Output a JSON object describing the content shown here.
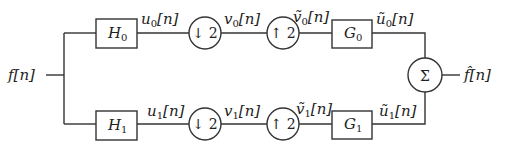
{
  "diagram": {
    "type": "two-channel filter bank",
    "input": {
      "label": "f[n]"
    },
    "output": {
      "label": "f̂[n]"
    },
    "sum_node": {
      "symbol": "Σ"
    },
    "branches": [
      {
        "analysis_filter": {
          "name": "H",
          "sub": "0"
        },
        "u_label": {
          "base": "u",
          "sub": "0",
          "tail": "[n]"
        },
        "downsample": {
          "symbol": "↓ 2"
        },
        "v_label": {
          "base": "v",
          "sub": "0",
          "tail": "[n]"
        },
        "upsample": {
          "symbol": "↑ 2"
        },
        "vt_label": {
          "base": "ṽ",
          "sub": "0",
          "tail": "[n]"
        },
        "synthesis_filter": {
          "name": "G",
          "sub": "0"
        },
        "ut_label": {
          "base": "ũ",
          "sub": "0",
          "tail": "[n]"
        }
      },
      {
        "analysis_filter": {
          "name": "H",
          "sub": "1"
        },
        "u_label": {
          "base": "u",
          "sub": "1",
          "tail": "[n]"
        },
        "downsample": {
          "symbol": "↓ 2"
        },
        "v_label": {
          "base": "v",
          "sub": "1",
          "tail": "[n]"
        },
        "upsample": {
          "symbol": "↑ 2"
        },
        "vt_label": {
          "base": "ṽ",
          "sub": "1",
          "tail": "[n]"
        },
        "synthesis_filter": {
          "name": "G",
          "sub": "1"
        },
        "ut_label": {
          "base": "ũ",
          "sub": "1",
          "tail": "[n]"
        }
      }
    ]
  }
}
